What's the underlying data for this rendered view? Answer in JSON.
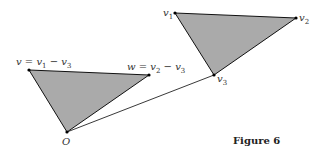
{
  "figure": {
    "caption": "Figure 6",
    "colors": {
      "fill": "#aaaaaa",
      "stroke": "#111111",
      "background": "#ffffff"
    },
    "left_triangle": {
      "vertices": {
        "v": {
          "label": "v = v1 − v3",
          "x": 29,
          "y": 70
        },
        "w": {
          "label": "w = v2 − v3",
          "x": 149,
          "y": 75
        },
        "O": {
          "label": "O",
          "x": 67,
          "y": 132
        }
      }
    },
    "right_triangle": {
      "vertices": {
        "v1": {
          "label": "v1",
          "x": 175,
          "y": 13
        },
        "v2": {
          "label": "v2",
          "x": 296,
          "y": 18
        },
        "v3": {
          "label": "v3",
          "x": 214,
          "y": 75
        }
      }
    },
    "connector": {
      "from": "O",
      "to": "v3"
    }
  }
}
